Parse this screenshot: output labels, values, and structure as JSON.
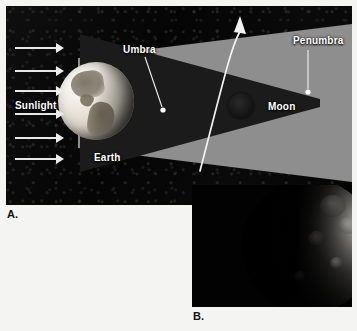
{
  "figure": {
    "captions": [
      {
        "id": "a",
        "label": "A.",
        "description": "Diagram of Earth's umbra and penumbra with the Moon entering the shadow"
      },
      {
        "id": "b",
        "label": "B.",
        "description": "Photograph of the partially eclipsed Moon"
      }
    ]
  },
  "panel_a": {
    "name": "eclipse-geometry-diagram",
    "background_color": "#070707",
    "labels": {
      "sunlight": "Sunlight",
      "umbra": "Umbra",
      "penumbra": "Penumbra",
      "moon": "Moon",
      "earth": "Earth"
    },
    "bodies": [
      {
        "name": "earth",
        "label": "Earth",
        "appearance": "illuminated sphere showing North and South America"
      },
      {
        "name": "moon",
        "label": "Moon",
        "appearance": "small dark disc inside the umbra"
      }
    ],
    "shadow_regions": [
      {
        "name": "umbra",
        "label": "Umbra",
        "color": "#1b1b1b",
        "shape": "converging dark cone behind Earth"
      },
      {
        "name": "penumbra",
        "label": "Penumbra",
        "color": "#8e8e8e",
        "shape": "diverging gray wedge surrounding the umbra"
      }
    ],
    "sunlight_rays": {
      "label": "Sunlight",
      "count": 6,
      "direction": "left to right",
      "color": "#e8e8e8"
    },
    "orbit_path": {
      "name": "moon-orbit-path",
      "color": "#f0f0f0",
      "arrow_direction": "upward",
      "description": "curved arrow showing the Moon's orbital motion through Earth's shadow"
    },
    "leader_lines": [
      {
        "target": "umbra",
        "dot_color": "#ffffff"
      },
      {
        "target": "penumbra",
        "dot_color": "#ffffff"
      }
    ]
  },
  "panel_b": {
    "name": "eclipsed-moon-photograph",
    "background_color": "#020202",
    "subject": "Moon",
    "description": "Telescopic photograph of the Moon largely in shadow with a bright crescent limb on the upper right"
  }
}
